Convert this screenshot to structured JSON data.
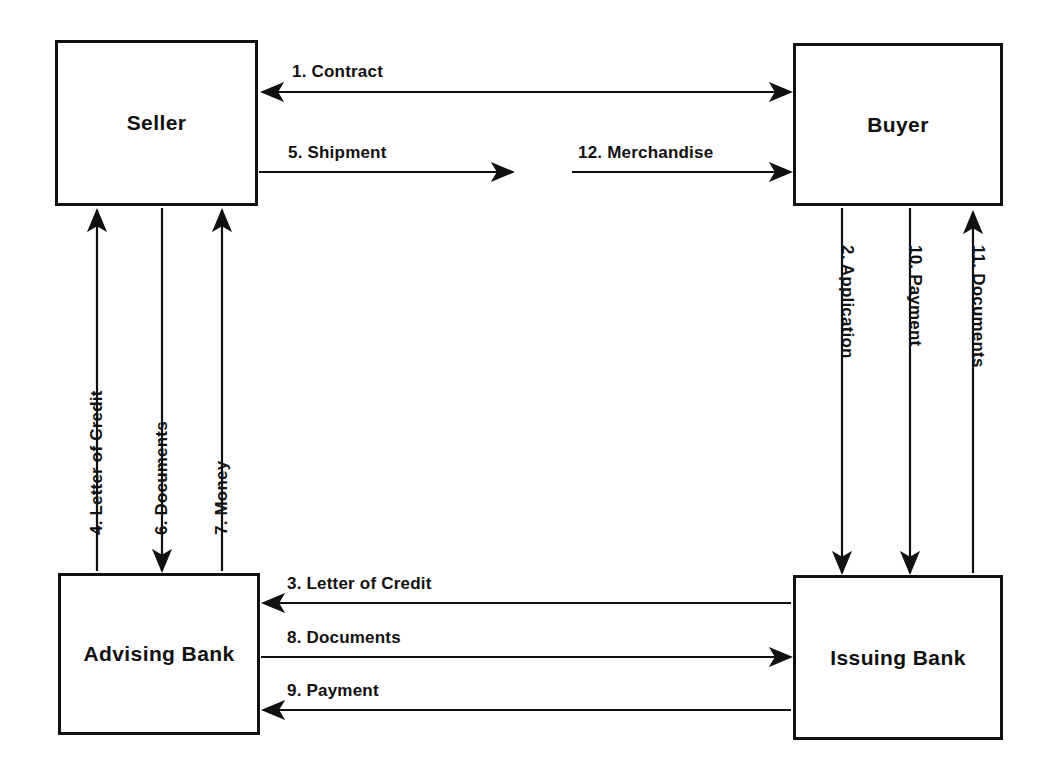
{
  "diagram": {
    "type": "flowchart",
    "line_color": "#111111",
    "background_color": "#ffffff",
    "entities": [
      {
        "id": "seller",
        "label": "Seller",
        "x": 55,
        "y": 40,
        "w": 203,
        "h": 166
      },
      {
        "id": "buyer",
        "label": "Buyer",
        "x": 793,
        "y": 43,
        "w": 210,
        "h": 163
      },
      {
        "id": "advising_bank",
        "label": "Advising Bank",
        "x": 58,
        "y": 573,
        "w": 202,
        "h": 162
      },
      {
        "id": "issuing_bank",
        "label": "Issuing Bank",
        "x": 793,
        "y": 575,
        "w": 210,
        "h": 165
      }
    ],
    "flows": [
      {
        "step": "1",
        "label": "1.  Contract",
        "from": "Buyer",
        "to": "Seller",
        "direction": "bidirectional-horizontal"
      },
      {
        "step": "2",
        "label": "2. Application",
        "from": "Buyer",
        "to": "Issuing Bank",
        "direction": "down"
      },
      {
        "step": "3",
        "label": "3.  Letter of Credit",
        "from": "Issuing Bank",
        "to": "Advising Bank",
        "direction": "left"
      },
      {
        "step": "4",
        "label": "4.  Letter of Credit",
        "from": "Advising Bank",
        "to": "Seller",
        "direction": "up"
      },
      {
        "step": "5",
        "label": "5.  Shipment",
        "from": "Seller",
        "to": "carrier",
        "direction": "right"
      },
      {
        "step": "6",
        "label": "6.  Documents",
        "from": "Seller",
        "to": "Advising Bank",
        "direction": "down"
      },
      {
        "step": "7",
        "label": "7.  Money",
        "from": "Advising Bank",
        "to": "Seller",
        "direction": "up"
      },
      {
        "step": "8",
        "label": "8.  Documents",
        "from": "Advising Bank",
        "to": "Issuing Bank",
        "direction": "right"
      },
      {
        "step": "9",
        "label": "9.  Payment",
        "from": "Issuing Bank",
        "to": "Advising Bank",
        "direction": "left"
      },
      {
        "step": "10",
        "label": "10. Payment",
        "from": "Buyer",
        "to": "Issuing Bank",
        "direction": "down"
      },
      {
        "step": "11",
        "label": "11. Documents",
        "from": "Issuing Bank",
        "to": "Buyer",
        "direction": "up"
      },
      {
        "step": "12",
        "label": "12.  Merchandise",
        "from": "carrier",
        "to": "Buyer",
        "direction": "right"
      }
    ]
  }
}
